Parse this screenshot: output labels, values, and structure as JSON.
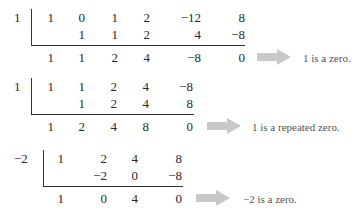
{
  "division1": {
    "divisor": "1",
    "row1": [
      "1",
      "0",
      "1",
      "2",
      "−12",
      "8"
    ],
    "row2": [
      "1",
      "1",
      "2",
      "4",
      "−8"
    ],
    "row3": [
      "1",
      "1",
      "2",
      "4",
      "−8",
      "0"
    ],
    "note": "1 is a zero."
  },
  "division2": {
    "divisor": "1",
    "row1": [
      "1",
      "1",
      "2",
      "4",
      "−8"
    ],
    "row2": [
      "1",
      "2",
      "4",
      "8"
    ],
    "row3": [
      "1",
      "2",
      "4",
      "8",
      "0"
    ],
    "note": "1 is a repeated zero."
  },
  "division3": {
    "divisor": "−2",
    "row1": [
      "1",
      "2",
      "4",
      "8"
    ],
    "row2": [
      "−2",
      "0",
      "−8"
    ],
    "row3": [
      "1",
      "0",
      "4",
      "0"
    ],
    "note": "−2 is a zero."
  },
  "arrow_color": "#c8c8c8"
}
